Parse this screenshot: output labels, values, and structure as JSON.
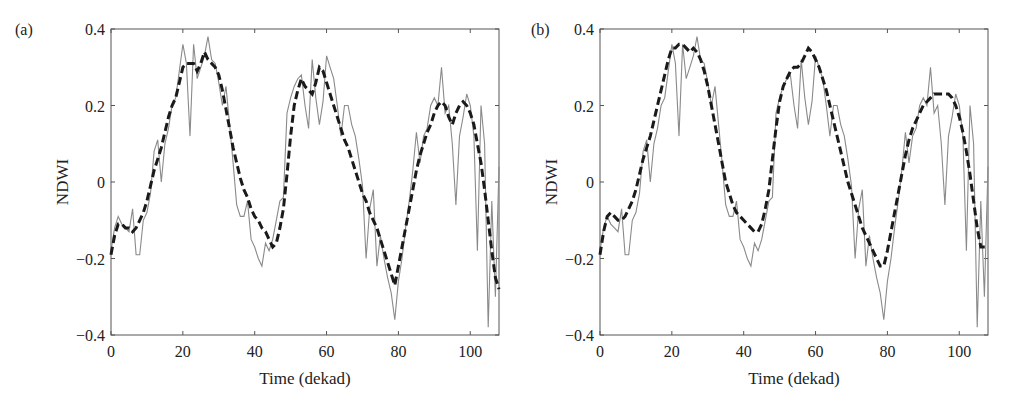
{
  "chart_data": [
    {
      "type": "line",
      "panel_label": "(a)",
      "title": "",
      "xlabel": "Time (dekad)",
      "ylabel": "NDWI",
      "xlim": [
        0,
        108
      ],
      "ylim": [
        -0.4,
        0.4
      ],
      "xticks": [
        0,
        20,
        40,
        60,
        80,
        100
      ],
      "yticks": [
        -0.4,
        -0.2,
        0,
        0.2,
        0.4
      ],
      "ytick_labels": [
        "−0.4",
        "−0.2",
        "0",
        "0.2",
        "0.4"
      ],
      "grid": false,
      "legend": "none",
      "x": [
        0,
        1,
        2,
        3,
        4,
        5,
        6,
        7,
        8,
        9,
        10,
        11,
        12,
        13,
        14,
        15,
        16,
        17,
        18,
        19,
        20,
        21,
        22,
        23,
        24,
        25,
        26,
        27,
        28,
        29,
        30,
        31,
        32,
        33,
        34,
        35,
        36,
        37,
        38,
        39,
        40,
        41,
        42,
        43,
        44,
        45,
        46,
        47,
        48,
        49,
        50,
        51,
        52,
        53,
        54,
        55,
        56,
        57,
        58,
        59,
        60,
        61,
        62,
        63,
        64,
        65,
        66,
        67,
        68,
        69,
        70,
        71,
        72,
        73,
        74,
        75,
        76,
        77,
        78,
        79,
        80,
        81,
        82,
        83,
        84,
        85,
        86,
        87,
        88,
        89,
        90,
        91,
        92,
        93,
        94,
        95,
        96,
        97,
        98,
        99,
        100,
        101,
        102,
        103,
        104,
        105,
        106,
        107,
        108
      ],
      "series": [
        {
          "name": "raw NDWI",
          "style": "thin solid gray",
          "color": "#8a8a8a",
          "values": [
            -0.18,
            -0.12,
            -0.09,
            -0.11,
            -0.12,
            -0.13,
            -0.07,
            -0.19,
            -0.19,
            -0.1,
            -0.08,
            -0.03,
            0.08,
            0.11,
            0.0,
            0.1,
            0.14,
            0.2,
            0.22,
            0.29,
            0.36,
            0.31,
            0.12,
            0.36,
            0.27,
            0.3,
            0.33,
            0.38,
            0.32,
            0.31,
            0.26,
            0.2,
            0.25,
            0.15,
            0.05,
            -0.06,
            -0.09,
            -0.09,
            -0.05,
            -0.15,
            -0.17,
            -0.2,
            -0.22,
            -0.16,
            -0.18,
            -0.15,
            -0.1,
            -0.05,
            -0.04,
            0.18,
            0.22,
            0.25,
            0.27,
            0.28,
            0.2,
            0.14,
            0.32,
            0.22,
            0.15,
            0.21,
            0.33,
            0.3,
            0.27,
            0.2,
            0.12,
            0.2,
            0.2,
            0.15,
            0.12,
            0.06,
            -0.01,
            -0.2,
            -0.07,
            -0.02,
            -0.22,
            -0.14,
            -0.2,
            -0.25,
            -0.29,
            -0.36,
            -0.26,
            -0.2,
            -0.12,
            -0.05,
            0.03,
            0.13,
            0.05,
            0.12,
            0.14,
            0.2,
            0.22,
            0.2,
            0.3,
            0.18,
            0.2,
            0.1,
            -0.06,
            0.12,
            0.17,
            0.23,
            0.2,
            0.12,
            -0.18,
            0.2,
            0.1,
            -0.38,
            -0.05,
            -0.3,
            0.04
          ]
        },
        {
          "name": "smoothed NDWI",
          "style": "thick dashed black",
          "color": "#1a1a1a",
          "values": [
            -0.19,
            -0.14,
            -0.11,
            -0.11,
            -0.12,
            -0.12,
            -0.13,
            -0.12,
            -0.1,
            -0.08,
            -0.05,
            -0.01,
            0.03,
            0.06,
            0.09,
            0.13,
            0.17,
            0.2,
            0.22,
            0.26,
            0.3,
            0.31,
            0.31,
            0.31,
            0.29,
            0.31,
            0.34,
            0.32,
            0.31,
            0.3,
            0.28,
            0.24,
            0.19,
            0.14,
            0.09,
            0.05,
            0.01,
            -0.02,
            -0.04,
            -0.07,
            -0.09,
            -0.1,
            -0.12,
            -0.13,
            -0.15,
            -0.17,
            -0.16,
            -0.12,
            -0.07,
            0.02,
            0.12,
            0.2,
            0.24,
            0.27,
            0.25,
            0.24,
            0.23,
            0.26,
            0.3,
            0.29,
            0.26,
            0.23,
            0.2,
            0.17,
            0.14,
            0.11,
            0.09,
            0.06,
            0.03,
            0.0,
            -0.03,
            -0.05,
            -0.08,
            -0.1,
            -0.12,
            -0.15,
            -0.18,
            -0.21,
            -0.24,
            -0.27,
            -0.22,
            -0.17,
            -0.12,
            -0.07,
            -0.02,
            0.03,
            0.07,
            0.1,
            0.13,
            0.15,
            0.18,
            0.2,
            0.21,
            0.2,
            0.17,
            0.15,
            0.18,
            0.2,
            0.21,
            0.2,
            0.18,
            0.15,
            0.1,
            0.05,
            -0.02,
            -0.1,
            -0.18,
            -0.25,
            -0.28
          ]
        }
      ]
    },
    {
      "type": "line",
      "panel_label": "(b)",
      "title": "",
      "xlabel": "Time (dekad)",
      "ylabel": "NDWI",
      "xlim": [
        0,
        108
      ],
      "ylim": [
        -0.4,
        0.4
      ],
      "xticks": [
        0,
        20,
        40,
        60,
        80,
        100
      ],
      "yticks": [
        -0.4,
        -0.2,
        0,
        0.2,
        0.4
      ],
      "ytick_labels": [
        "−0.4",
        "−0.2",
        "0",
        "0.2",
        "0.4"
      ],
      "grid": false,
      "legend": "none",
      "x": [
        0,
        1,
        2,
        3,
        4,
        5,
        6,
        7,
        8,
        9,
        10,
        11,
        12,
        13,
        14,
        15,
        16,
        17,
        18,
        19,
        20,
        21,
        22,
        23,
        24,
        25,
        26,
        27,
        28,
        29,
        30,
        31,
        32,
        33,
        34,
        35,
        36,
        37,
        38,
        39,
        40,
        41,
        42,
        43,
        44,
        45,
        46,
        47,
        48,
        49,
        50,
        51,
        52,
        53,
        54,
        55,
        56,
        57,
        58,
        59,
        60,
        61,
        62,
        63,
        64,
        65,
        66,
        67,
        68,
        69,
        70,
        71,
        72,
        73,
        74,
        75,
        76,
        77,
        78,
        79,
        80,
        81,
        82,
        83,
        84,
        85,
        86,
        87,
        88,
        89,
        90,
        91,
        92,
        93,
        94,
        95,
        96,
        97,
        98,
        99,
        100,
        101,
        102,
        103,
        104,
        105,
        106,
        107,
        108
      ],
      "series": [
        {
          "name": "raw NDWI",
          "style": "thin solid gray",
          "color": "#8a8a8a",
          "values": [
            -0.18,
            -0.12,
            -0.09,
            -0.11,
            -0.12,
            -0.13,
            -0.07,
            -0.19,
            -0.19,
            -0.1,
            -0.08,
            -0.03,
            0.08,
            0.11,
            0.0,
            0.1,
            0.14,
            0.2,
            0.22,
            0.29,
            0.36,
            0.31,
            0.12,
            0.36,
            0.27,
            0.3,
            0.33,
            0.38,
            0.32,
            0.31,
            0.26,
            0.2,
            0.25,
            0.15,
            0.05,
            -0.06,
            -0.09,
            -0.09,
            -0.05,
            -0.15,
            -0.17,
            -0.2,
            -0.22,
            -0.16,
            -0.18,
            -0.15,
            -0.1,
            -0.05,
            -0.04,
            0.18,
            0.22,
            0.25,
            0.27,
            0.28,
            0.2,
            0.14,
            0.32,
            0.22,
            0.15,
            0.21,
            0.33,
            0.3,
            0.27,
            0.2,
            0.12,
            0.2,
            0.2,
            0.15,
            0.12,
            0.06,
            -0.01,
            -0.2,
            -0.07,
            -0.02,
            -0.22,
            -0.14,
            -0.2,
            -0.25,
            -0.29,
            -0.36,
            -0.26,
            -0.2,
            -0.12,
            -0.05,
            0.03,
            0.13,
            0.05,
            0.12,
            0.14,
            0.2,
            0.22,
            0.2,
            0.3,
            0.18,
            0.2,
            0.1,
            -0.06,
            0.12,
            0.17,
            0.23,
            0.2,
            0.12,
            -0.18,
            0.2,
            0.1,
            -0.38,
            -0.05,
            -0.3,
            0.04
          ]
        },
        {
          "name": "smoothed NDWI",
          "style": "thick dashed black",
          "color": "#1a1a1a",
          "values": [
            -0.19,
            -0.13,
            -0.09,
            -0.08,
            -0.09,
            -0.1,
            -0.1,
            -0.09,
            -0.07,
            -0.05,
            -0.02,
            0.02,
            0.06,
            0.09,
            0.12,
            0.16,
            0.2,
            0.24,
            0.28,
            0.32,
            0.35,
            0.35,
            0.36,
            0.36,
            0.35,
            0.34,
            0.35,
            0.34,
            0.32,
            0.29,
            0.25,
            0.2,
            0.15,
            0.1,
            0.05,
            0.0,
            -0.03,
            -0.06,
            -0.08,
            -0.09,
            -0.1,
            -0.11,
            -0.12,
            -0.13,
            -0.13,
            -0.11,
            -0.07,
            -0.02,
            0.06,
            0.14,
            0.21,
            0.25,
            0.27,
            0.29,
            0.3,
            0.3,
            0.31,
            0.33,
            0.35,
            0.34,
            0.32,
            0.3,
            0.27,
            0.24,
            0.2,
            0.16,
            0.12,
            0.08,
            0.04,
            0.0,
            -0.03,
            -0.06,
            -0.09,
            -0.12,
            -0.14,
            -0.16,
            -0.18,
            -0.2,
            -0.22,
            -0.22,
            -0.18,
            -0.13,
            -0.08,
            -0.03,
            0.02,
            0.07,
            0.11,
            0.14,
            0.16,
            0.18,
            0.2,
            0.21,
            0.22,
            0.23,
            0.23,
            0.23,
            0.23,
            0.23,
            0.22,
            0.2,
            0.17,
            0.13,
            0.08,
            0.02,
            -0.05,
            -0.12,
            -0.17,
            -0.17,
            -0.17
          ]
        }
      ]
    }
  ]
}
